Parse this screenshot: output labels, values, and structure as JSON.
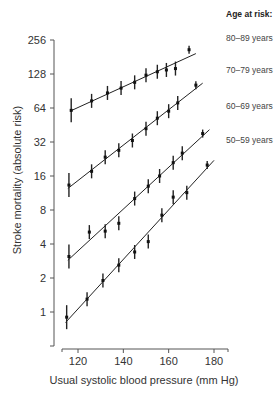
{
  "chart_data": {
    "type": "scatter",
    "title": "",
    "xlabel": "Usual systolic blood pressure (mm Hg)",
    "ylabel": "Stroke mortality (absolute risk)",
    "x_ticks": [
      120,
      140,
      160,
      180
    ],
    "y_ticks": [
      1,
      2,
      4,
      8,
      16,
      32,
      64,
      128,
      256
    ],
    "y_scale": "log2",
    "xlim": [
      113,
      186
    ],
    "ylim": [
      0.5,
      256
    ],
    "grid": false,
    "legend_title": "Age at risk:",
    "legend_position": "right",
    "series": [
      {
        "name": "80–89 years",
        "x": [
          117,
          126,
          133,
          139,
          145,
          150,
          155,
          159,
          163,
          169
        ],
        "y": [
          61,
          74,
          87,
          96,
          108,
          125,
          134,
          139,
          143,
          210
        ]
      },
      {
        "name": "70–79 years",
        "x": [
          116,
          126,
          132,
          138,
          144,
          150,
          155,
          160,
          164,
          172
        ],
        "y": [
          13.3,
          17.6,
          23.5,
          27,
          33,
          42,
          52,
          60,
          71,
          102
        ]
      },
      {
        "name": "60–69 years",
        "x": [
          116,
          125,
          132,
          138,
          145,
          151,
          156,
          162,
          166,
          175
        ],
        "y": [
          3.1,
          5.1,
          5.2,
          6.1,
          10.1,
          13,
          16,
          21,
          25.5,
          38
        ]
      },
      {
        "name": "50–59 years",
        "x": [
          115,
          124,
          131,
          138,
          145,
          151,
          157,
          162,
          168,
          177
        ],
        "y": [
          0.9,
          1.3,
          1.9,
          2.6,
          3.4,
          4.2,
          7.2,
          10.4,
          11.4,
          20
        ]
      }
    ]
  },
  "legend": {
    "title": "Age at risk:",
    "items": [
      "80–89 years",
      "70–79 years",
      "60–69 years",
      "50–59 years"
    ]
  },
  "axes": {
    "x_title": "Usual systolic blood pressure (mm Hg)",
    "y_title": "Stroke mortality (absolute risk)",
    "x_tick_labels": [
      "120",
      "140",
      "160",
      "180"
    ],
    "y_tick_labels": [
      "256",
      "128",
      "64",
      "32",
      "16",
      "8",
      "4",
      "2",
      "1"
    ]
  },
  "colors": {
    "line": "#222222",
    "axis": "#555555",
    "text": "#333333"
  }
}
